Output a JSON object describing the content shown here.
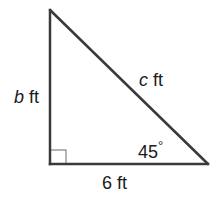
{
  "diagram": {
    "type": "right-triangle",
    "colors": {
      "stroke": "#3a3a3a",
      "right_angle_marker": "#6a6a6a",
      "text": "#1a1a1a",
      "background": "#ffffff"
    },
    "vertices": {
      "top": [
        50,
        10
      ],
      "bottom_left": [
        50,
        164
      ],
      "bottom_right": [
        208,
        164
      ]
    },
    "sides": {
      "vertical": {
        "variable": "b",
        "unit": " ft"
      },
      "hypotenuse": {
        "variable": "c",
        "unit": " ft"
      },
      "base": {
        "label": "6 ft"
      }
    },
    "angle": {
      "label": "45",
      "degree_symbol": "°"
    },
    "right_angle_marker": true
  }
}
